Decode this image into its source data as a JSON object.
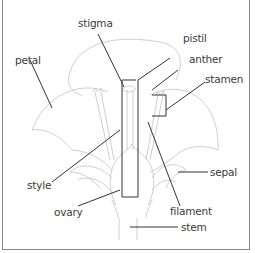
{
  "diagram": {
    "labels": {
      "stigma": "stigma",
      "pistil": "pistil",
      "petal": "petal",
      "anther": "anther",
      "stamen": "stamen",
      "style": "style",
      "sepal": "sepal",
      "ovary": "ovary",
      "filament": "filament",
      "stem": "stem"
    },
    "colors": {
      "outline": "#c8c8c8",
      "leader": "#333333",
      "text": "#3a3a3a",
      "border": "#8a8a8a"
    }
  }
}
